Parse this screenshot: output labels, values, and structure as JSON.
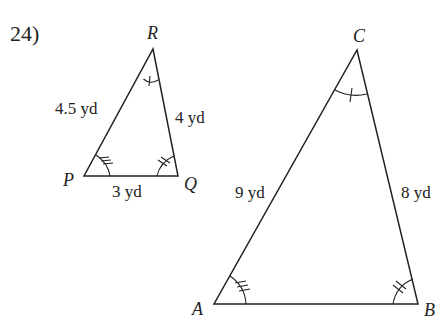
{
  "problem": {
    "number": "24)"
  },
  "small_triangle": {
    "name": "triangle-PQR",
    "vertices": {
      "P": {
        "label": "P",
        "x": 84,
        "y": 176
      },
      "Q": {
        "label": "Q",
        "x": 178,
        "y": 176
      },
      "R": {
        "label": "R",
        "x": 153,
        "y": 49
      }
    },
    "sides": {
      "PR": "4.5 yd",
      "RQ": "4 yd",
      "PQ": "3 yd"
    },
    "angle_marks": {
      "R": 1,
      "P": 3,
      "Q": 2
    }
  },
  "large_triangle": {
    "name": "triangle-ABC",
    "vertices": {
      "A": {
        "label": "A",
        "x": 214,
        "y": 304
      },
      "B": {
        "label": "B",
        "x": 418,
        "y": 304
      },
      "C": {
        "label": "C",
        "x": 357,
        "y": 50
      }
    },
    "sides": {
      "AC": "9 yd",
      "CB": "8 yd"
    },
    "angle_marks": {
      "C": 1,
      "A": 3,
      "B": 2
    }
  },
  "colors": {
    "stroke": "#222222",
    "background": "#ffffff"
  }
}
